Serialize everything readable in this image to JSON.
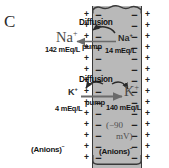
{
  "panel": {
    "letter": "C"
  },
  "diagram": {
    "title_letter": "C",
    "cell_fill_color": "#b9b9b9",
    "outline_color": "#3a3a3a",
    "membrane_potential": {
      "line1": "(−90",
      "line2": "mV)"
    },
    "charges": {
      "outside_sign": "+",
      "inside_sign": "−",
      "rows": 14
    },
    "sodium": {
      "diffusion_label": "Diffusion",
      "pump_label": "pump",
      "outside_ion": "Na",
      "outside_charge": "+",
      "outside_concentration": "142 mEq/L",
      "inside_ion": "Na",
      "inside_charge": "+",
      "inside_concentration": "14 mEq/L"
    },
    "potassium": {
      "diffusion_label": "Diffusion",
      "pump_label": "pump",
      "outside_ion": "K",
      "outside_charge": "+",
      "outside_concentration": "4 mEq/L",
      "inside_ion": "K",
      "inside_charge": "+",
      "inside_concentration": "140 mEq/L"
    },
    "anions": {
      "outside_label": "(Anions)",
      "outside_charge": "−",
      "inside_label": "(Anions)",
      "inside_charge": "−"
    }
  }
}
